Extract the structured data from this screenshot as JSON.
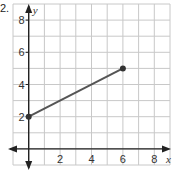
{
  "problem_number": "2.",
  "chart_data": {
    "type": "line",
    "title": "",
    "xlabel": "x",
    "ylabel": "y",
    "xlim": [
      -1,
      9
    ],
    "ylim": [
      -1,
      9
    ],
    "grid": true,
    "grid_step": 1,
    "x_ticks": [
      2,
      4,
      6,
      8
    ],
    "y_ticks": [
      2,
      4,
      6,
      8
    ],
    "series": [
      {
        "name": "segment",
        "points": [
          [
            0,
            2
          ],
          [
            6,
            5
          ]
        ],
        "endpoints": "closed-dots",
        "color": "#555555"
      }
    ],
    "axis_color": "#222222",
    "grid_color": "#c8c8c8"
  }
}
